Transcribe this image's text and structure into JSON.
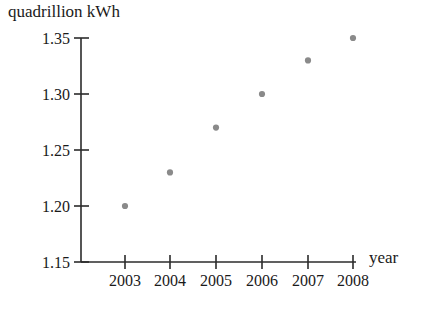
{
  "chart_data": {
    "type": "scatter",
    "title": "",
    "xlabel": "year",
    "ylabel": "quadrillion kWh",
    "x": [
      2003,
      2004,
      2005,
      2006,
      2007,
      2008
    ],
    "values": [
      1.2,
      1.23,
      1.27,
      1.3,
      1.33,
      1.35
    ],
    "categories": [
      "2003",
      "2004",
      "2005",
      "2006",
      "2007",
      "2008"
    ],
    "xtick_labels": [
      "2003",
      "2004",
      "2005",
      "2006",
      "2007",
      "2008"
    ],
    "ytick_labels": [
      "1.15",
      "1.20",
      "1.25",
      "1.30",
      "1.35"
    ],
    "ytick_values": [
      1.15,
      1.2,
      1.25,
      1.3,
      1.35
    ],
    "ylim": [
      1.15,
      1.35
    ],
    "xlim": [
      2002.5,
      2008.5
    ],
    "grid": false,
    "legend": null,
    "marker_color": "#8a8a8a",
    "axis_color": "#2b2b2b",
    "point_labels": [
      "1.20",
      "1.23",
      "1.27",
      "1.30",
      "1.33",
      "1.35"
    ]
  },
  "axes": {
    "y_axis_title": "quadrillion kWh",
    "x_axis_title": "year"
  }
}
